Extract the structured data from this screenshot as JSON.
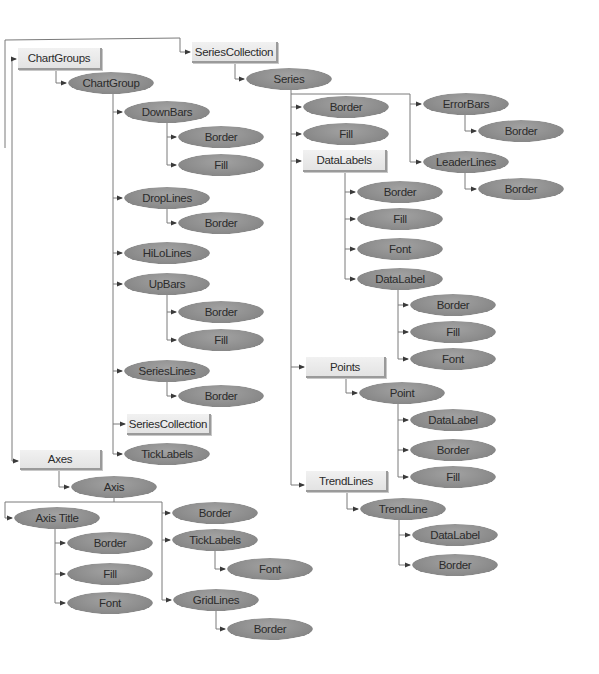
{
  "diagram": {
    "title": "",
    "colors": {
      "oval_fill": "#8e8e8e",
      "box_fill": "#ebebeb",
      "line": "#7a7a7a",
      "text": "#2b2b2b"
    },
    "nodes": [
      {
        "id": "chartgroups",
        "label": "ChartGroups",
        "shape": "box",
        "x": 18,
        "y": 48,
        "w": 84,
        "h": 22
      },
      {
        "id": "chartgroup",
        "label": "ChartGroup",
        "shape": "oval",
        "x": 68,
        "y": 72,
        "w": 86,
        "h": 22
      },
      {
        "id": "downbars",
        "label": "DownBars",
        "shape": "oval",
        "x": 124,
        "y": 101,
        "w": 86,
        "h": 22
      },
      {
        "id": "downbars-border",
        "label": "Border",
        "shape": "oval",
        "x": 178,
        "y": 126,
        "w": 86,
        "h": 22
      },
      {
        "id": "downbars-fill",
        "label": "Fill",
        "shape": "oval",
        "x": 178,
        "y": 154,
        "w": 86,
        "h": 22
      },
      {
        "id": "droplines",
        "label": "DropLines",
        "shape": "oval",
        "x": 124,
        "y": 187,
        "w": 86,
        "h": 22
      },
      {
        "id": "droplines-border",
        "label": "Border",
        "shape": "oval",
        "x": 178,
        "y": 212,
        "w": 86,
        "h": 22
      },
      {
        "id": "hilolines",
        "label": "HiLoLines",
        "shape": "oval",
        "x": 124,
        "y": 242,
        "w": 86,
        "h": 22
      },
      {
        "id": "upbars",
        "label": "UpBars",
        "shape": "oval",
        "x": 124,
        "y": 273,
        "w": 86,
        "h": 22
      },
      {
        "id": "upbars-border",
        "label": "Border",
        "shape": "oval",
        "x": 178,
        "y": 301,
        "w": 86,
        "h": 22
      },
      {
        "id": "upbars-fill",
        "label": "Fill",
        "shape": "oval",
        "x": 178,
        "y": 329,
        "w": 86,
        "h": 22
      },
      {
        "id": "serieslines",
        "label": "SeriesLines",
        "shape": "oval",
        "x": 124,
        "y": 360,
        "w": 86,
        "h": 22
      },
      {
        "id": "serieslines-border",
        "label": "Border",
        "shape": "oval",
        "x": 178,
        "y": 385,
        "w": 86,
        "h": 22
      },
      {
        "id": "seriescollection-inner",
        "label": "SeriesCollection",
        "shape": "box",
        "x": 127,
        "y": 414,
        "w": 84,
        "h": 21
      },
      {
        "id": "ticklabels-cg",
        "label": "TickLabels",
        "shape": "oval",
        "x": 124,
        "y": 443,
        "w": 86,
        "h": 22
      },
      {
        "id": "seriescollection",
        "label": "SeriesCollection",
        "shape": "box",
        "x": 192,
        "y": 42,
        "w": 86,
        "h": 21
      },
      {
        "id": "series",
        "label": "Series",
        "shape": "oval",
        "x": 246,
        "y": 68,
        "w": 86,
        "h": 22
      },
      {
        "id": "series-border",
        "label": "Border",
        "shape": "oval",
        "x": 303,
        "y": 96,
        "w": 86,
        "h": 22
      },
      {
        "id": "series-fill",
        "label": "Fill",
        "shape": "oval",
        "x": 303,
        "y": 123,
        "w": 86,
        "h": 22
      },
      {
        "id": "datalabels",
        "label": "DataLabels",
        "shape": "box",
        "x": 303,
        "y": 150,
        "w": 84,
        "h": 22
      },
      {
        "id": "datalabels-border",
        "label": "Border",
        "shape": "oval",
        "x": 357,
        "y": 181,
        "w": 86,
        "h": 22
      },
      {
        "id": "datalabels-fill",
        "label": "Fill",
        "shape": "oval",
        "x": 357,
        "y": 208,
        "w": 86,
        "h": 22
      },
      {
        "id": "datalabels-font",
        "label": "Font",
        "shape": "oval",
        "x": 357,
        "y": 238,
        "w": 86,
        "h": 22
      },
      {
        "id": "datalabel",
        "label": "DataLabel",
        "shape": "oval",
        "x": 357,
        "y": 268,
        "w": 86,
        "h": 22
      },
      {
        "id": "datalabel-border",
        "label": "Border",
        "shape": "oval",
        "x": 410,
        "y": 294,
        "w": 86,
        "h": 22
      },
      {
        "id": "datalabel-fill",
        "label": "Fill",
        "shape": "oval",
        "x": 410,
        "y": 321,
        "w": 86,
        "h": 22
      },
      {
        "id": "datalabel-font",
        "label": "Font",
        "shape": "oval",
        "x": 410,
        "y": 348,
        "w": 86,
        "h": 22
      },
      {
        "id": "points",
        "label": "Points",
        "shape": "box",
        "x": 306,
        "y": 357,
        "w": 80,
        "h": 21
      },
      {
        "id": "point",
        "label": "Point",
        "shape": "oval",
        "x": 359,
        "y": 382,
        "w": 86,
        "h": 22
      },
      {
        "id": "point-datalabel",
        "label": "DataLabel",
        "shape": "oval",
        "x": 410,
        "y": 409,
        "w": 86,
        "h": 22
      },
      {
        "id": "point-border",
        "label": "Border",
        "shape": "oval",
        "x": 410,
        "y": 439,
        "w": 86,
        "h": 22
      },
      {
        "id": "point-fill",
        "label": "Fill",
        "shape": "oval",
        "x": 410,
        "y": 466,
        "w": 86,
        "h": 22
      },
      {
        "id": "trendlines",
        "label": "TrendLines",
        "shape": "box",
        "x": 306,
        "y": 471,
        "w": 82,
        "h": 21
      },
      {
        "id": "trendline",
        "label": "TrendLine",
        "shape": "oval",
        "x": 360,
        "y": 498,
        "w": 86,
        "h": 22
      },
      {
        "id": "trendline-datalabel",
        "label": "DataLabel",
        "shape": "oval",
        "x": 412,
        "y": 524,
        "w": 86,
        "h": 22
      },
      {
        "id": "trendline-border",
        "label": "Border",
        "shape": "oval",
        "x": 412,
        "y": 554,
        "w": 86,
        "h": 22
      },
      {
        "id": "errorbars",
        "label": "ErrorBars",
        "shape": "oval",
        "x": 423,
        "y": 93,
        "w": 86,
        "h": 22
      },
      {
        "id": "errorbars-border",
        "label": "Border",
        "shape": "oval",
        "x": 478,
        "y": 120,
        "w": 86,
        "h": 22
      },
      {
        "id": "leaderlines",
        "label": "LeaderLines",
        "shape": "oval",
        "x": 423,
        "y": 151,
        "w": 86,
        "h": 22
      },
      {
        "id": "leaderlines-border",
        "label": "Border",
        "shape": "oval",
        "x": 478,
        "y": 178,
        "w": 86,
        "h": 22
      },
      {
        "id": "axes",
        "label": "Axes",
        "shape": "box",
        "x": 20,
        "y": 450,
        "w": 82,
        "h": 20
      },
      {
        "id": "axis",
        "label": "Axis",
        "shape": "oval",
        "x": 71,
        "y": 476,
        "w": 86,
        "h": 22
      },
      {
        "id": "axistitle",
        "label": "Axis Title",
        "shape": "oval",
        "x": 14,
        "y": 507,
        "w": 86,
        "h": 22
      },
      {
        "id": "axistitle-border",
        "label": "Border",
        "shape": "oval",
        "x": 67,
        "y": 532,
        "w": 86,
        "h": 22
      },
      {
        "id": "axistitle-fill",
        "label": "Fill",
        "shape": "oval",
        "x": 67,
        "y": 563,
        "w": 86,
        "h": 22
      },
      {
        "id": "axistitle-font",
        "label": "Font",
        "shape": "oval",
        "x": 67,
        "y": 592,
        "w": 86,
        "h": 22
      },
      {
        "id": "axis-border",
        "label": "Border",
        "shape": "oval",
        "x": 172,
        "y": 502,
        "w": 86,
        "h": 22
      },
      {
        "id": "axis-ticklabels",
        "label": "TickLabels",
        "shape": "oval",
        "x": 172,
        "y": 529,
        "w": 86,
        "h": 22
      },
      {
        "id": "ticklabels-font",
        "label": "Font",
        "shape": "oval",
        "x": 227,
        "y": 558,
        "w": 86,
        "h": 22
      },
      {
        "id": "gridlines",
        "label": "GridLines",
        "shape": "oval",
        "x": 173,
        "y": 589,
        "w": 86,
        "h": 22
      },
      {
        "id": "gridlines-border",
        "label": "Border",
        "shape": "oval",
        "x": 227,
        "y": 618,
        "w": 86,
        "h": 22
      }
    ],
    "edges": [
      {
        "path": "M5,148 L5,40 L180,38 L180,52 L190,52",
        "arrow": true
      },
      {
        "path": "M12,148 L12,59 L16,59",
        "arrow": true
      },
      {
        "path": "M12,148 L12,461 L18,461",
        "arrow": true
      },
      {
        "path": "M56,70 L56,83 L66,83",
        "arrow": true
      },
      {
        "path": "M113,94 L113,454",
        "arrow": false
      },
      {
        "path": "M113,112 L122,112",
        "arrow": true
      },
      {
        "path": "M167,123 L167,165",
        "arrow": false
      },
      {
        "path": "M167,137 L176,137",
        "arrow": true
      },
      {
        "path": "M167,165 L176,165",
        "arrow": true
      },
      {
        "path": "M113,198 L122,198",
        "arrow": true
      },
      {
        "path": "M167,209 L167,223 L176,223",
        "arrow": true
      },
      {
        "path": "M113,253 L122,253",
        "arrow": true
      },
      {
        "path": "M113,284 L122,284",
        "arrow": true
      },
      {
        "path": "M167,295 L167,340",
        "arrow": false
      },
      {
        "path": "M167,312 L176,312",
        "arrow": true
      },
      {
        "path": "M167,340 L176,340",
        "arrow": true
      },
      {
        "path": "M113,371 L122,371",
        "arrow": true
      },
      {
        "path": "M167,382 L167,396 L176,396",
        "arrow": true
      },
      {
        "path": "M113,424 L125,424",
        "arrow": true
      },
      {
        "path": "M113,454 L122,454",
        "arrow": true
      },
      {
        "path": "M235,63 L235,79 L244,79",
        "arrow": true
      },
      {
        "path": "M291,90 L291,485",
        "arrow": false
      },
      {
        "path": "M291,94 L410,94 L410,162",
        "arrow": false
      },
      {
        "path": "M410,104 L421,104",
        "arrow": true
      },
      {
        "path": "M410,162 L421,162",
        "arrow": true
      },
      {
        "path": "M465,115 L465,131 L476,131",
        "arrow": true
      },
      {
        "path": "M465,173 L465,189 L476,189",
        "arrow": true
      },
      {
        "path": "M291,107 L301,107",
        "arrow": true
      },
      {
        "path": "M291,134 L301,134",
        "arrow": true
      },
      {
        "path": "M291,161 L301,161",
        "arrow": true
      },
      {
        "path": "M345,172 L345,279",
        "arrow": false
      },
      {
        "path": "M345,192 L355,192",
        "arrow": true
      },
      {
        "path": "M345,219 L355,219",
        "arrow": true
      },
      {
        "path": "M345,249 L355,249",
        "arrow": true
      },
      {
        "path": "M345,279 L355,279",
        "arrow": true
      },
      {
        "path": "M398,290 L398,359",
        "arrow": false
      },
      {
        "path": "M398,305 L408,305",
        "arrow": true
      },
      {
        "path": "M398,332 L408,332",
        "arrow": true
      },
      {
        "path": "M398,359 L408,359",
        "arrow": true
      },
      {
        "path": "M291,367 L304,367",
        "arrow": true
      },
      {
        "path": "M346,378 L346,393 L357,393",
        "arrow": true
      },
      {
        "path": "M398,404 L398,477",
        "arrow": false
      },
      {
        "path": "M398,420 L408,420",
        "arrow": true
      },
      {
        "path": "M398,450 L408,450",
        "arrow": true
      },
      {
        "path": "M398,477 L408,477",
        "arrow": true
      },
      {
        "path": "M291,485 L304,485",
        "arrow": true
      },
      {
        "path": "M347,492 L347,509 L358,509",
        "arrow": true
      },
      {
        "path": "M399,520 L399,565",
        "arrow": false
      },
      {
        "path": "M399,535 L410,535",
        "arrow": true
      },
      {
        "path": "M399,565 L410,565",
        "arrow": true
      },
      {
        "path": "M59,470 L59,487 L69,487",
        "arrow": true
      },
      {
        "path": "M114,498 L114,502 L5,502 L5,518 L12,518",
        "arrow": true
      },
      {
        "path": "M114,502 L162,502 L162,600",
        "arrow": false
      },
      {
        "path": "M162,513 L170,513",
        "arrow": true
      },
      {
        "path": "M162,540 L170,540",
        "arrow": true
      },
      {
        "path": "M162,600 L171,600",
        "arrow": true
      },
      {
        "path": "M55,529 L55,603",
        "arrow": false
      },
      {
        "path": "M55,543 L65,543",
        "arrow": true
      },
      {
        "path": "M55,574 L65,574",
        "arrow": true
      },
      {
        "path": "M55,603 L65,603",
        "arrow": true
      },
      {
        "path": "M215,551 L215,569 L225,569",
        "arrow": true
      },
      {
        "path": "M216,611 L216,629 L225,629",
        "arrow": true
      }
    ]
  }
}
